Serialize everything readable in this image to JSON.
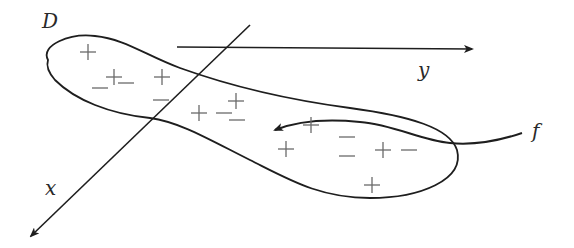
{
  "diagram": {
    "region_label": "D",
    "axis_y_label": "y",
    "axis_x_label": "x",
    "function_label": "f",
    "signs": [
      {
        "s": "+",
        "x": 88,
        "y": 52
      },
      {
        "s": "−",
        "x": 100,
        "y": 88
      },
      {
        "s": "+",
        "x": 114,
        "y": 77
      },
      {
        "s": "−",
        "x": 126,
        "y": 83
      },
      {
        "s": "+",
        "x": 162,
        "y": 77
      },
      {
        "s": "−",
        "x": 161,
        "y": 100
      },
      {
        "s": "+",
        "x": 199,
        "y": 113
      },
      {
        "s": "−",
        "x": 224,
        "y": 113
      },
      {
        "s": "+",
        "x": 236,
        "y": 101
      },
      {
        "s": "−",
        "x": 237,
        "y": 120
      },
      {
        "s": "+",
        "x": 311,
        "y": 125
      },
      {
        "s": "+",
        "x": 286,
        "y": 149
      },
      {
        "s": "−",
        "x": 347,
        "y": 137
      },
      {
        "s": "−",
        "x": 347,
        "y": 156
      },
      {
        "s": "+",
        "x": 383,
        "y": 150
      },
      {
        "s": "−",
        "x": 409,
        "y": 150
      },
      {
        "s": "+",
        "x": 372,
        "y": 185
      }
    ],
    "colors": {
      "stroke": "#1e1e1e",
      "sign": "#6a6a6a",
      "background": "#ffffff"
    }
  }
}
